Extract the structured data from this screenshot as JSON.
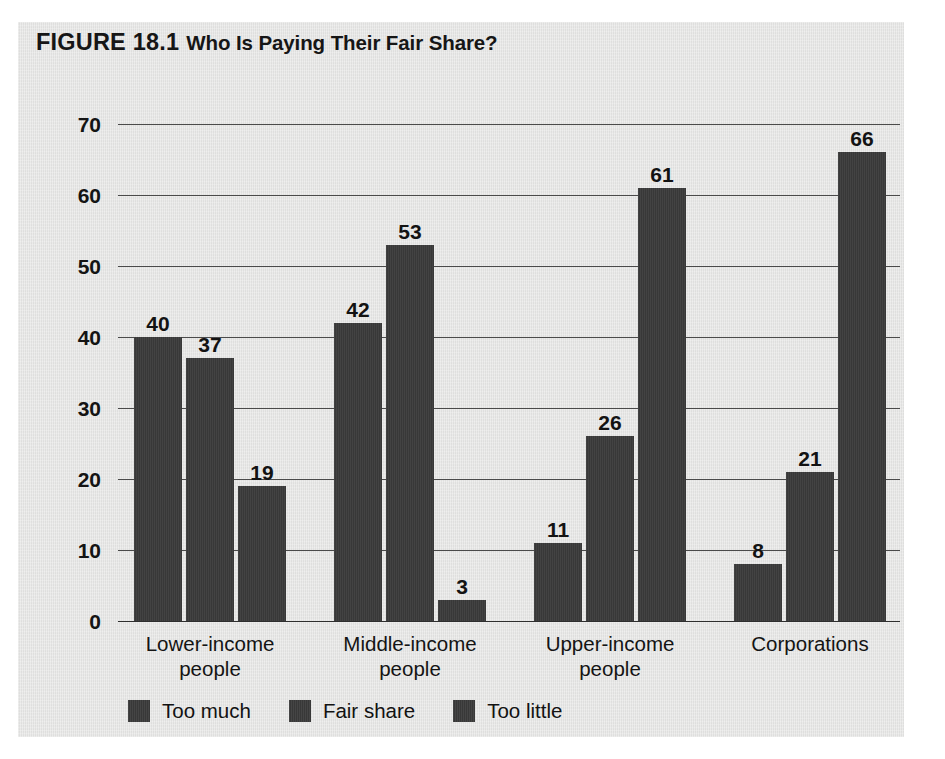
{
  "figure": {
    "label": "FIGURE 18.1",
    "heading": "Who Is Paying Their Fair Share?",
    "panel_color": "#e3e3e2",
    "bar_color": "#3b3b3b",
    "text_color": "#141414"
  },
  "chart_data": {
    "type": "bar",
    "xlabel": "",
    "ylabel": "",
    "ylim": [
      0,
      70
    ],
    "yticks": [
      0,
      10,
      20,
      30,
      40,
      50,
      60,
      70
    ],
    "grid": true,
    "legend_position": "bottom-left",
    "categories": [
      "Lower-income people",
      "Middle-income people",
      "Upper-income people",
      "Corporations"
    ],
    "category_lines": [
      [
        "Lower-income",
        "people"
      ],
      [
        "Middle-income",
        "people"
      ],
      [
        "Upper-income",
        "people"
      ],
      [
        "Corporations",
        ""
      ]
    ],
    "series": [
      {
        "name": "Too much",
        "values": [
          40,
          42,
          11,
          8
        ]
      },
      {
        "name": "Fair share",
        "values": [
          37,
          53,
          26,
          21
        ]
      },
      {
        "name": "Too little",
        "values": [
          19,
          3,
          61,
          66
        ]
      }
    ]
  }
}
